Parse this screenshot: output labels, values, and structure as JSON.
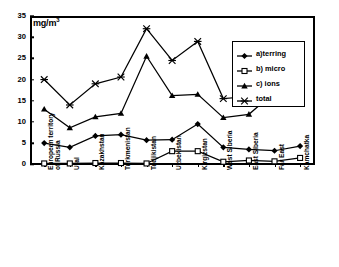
{
  "chart_data": {
    "type": "line",
    "title": "",
    "subtitle": "",
    "unit_label": "mg/m3",
    "unit_label_display": "mg/m",
    "unit_exponent": "3",
    "xlabel": "",
    "ylabel": "",
    "ylim": [
      0,
      35
    ],
    "ytick_step": 5,
    "yticks": [
      0,
      5,
      10,
      15,
      20,
      25,
      30,
      35
    ],
    "ytick_labels": [
      "0",
      "5",
      "10",
      "15",
      "20",
      "25",
      "30",
      "35"
    ],
    "grid": false,
    "legend_position": "upper right (boxed, inside plot)",
    "categories": [
      "European territory\nof Russia",
      "Ural",
      "Kazakhstan",
      "Turkmenistan",
      "Tadjikistan",
      "Uzbekistan",
      "Kirgizstan",
      "West Siberia",
      "East Siberia",
      "Far East",
      "Kamchatka"
    ],
    "series": [
      {
        "name": "a)terring",
        "marker": "diamond",
        "color": "#000000",
        "values": [
          5.0,
          4.0,
          6.7,
          7.0,
          5.7,
          5.8,
          9.5,
          4.0,
          3.5,
          3.2,
          4.3
        ]
      },
      {
        "name": "b) micro",
        "marker": "square-open",
        "color": "#000000",
        "values": [
          0.2,
          0.2,
          0.3,
          0.3,
          0.2,
          3.1,
          3.1,
          0.6,
          0.9,
          0.7,
          1.5
        ]
      },
      {
        "name": "c) ions",
        "marker": "triangle",
        "color": "#000000",
        "values": [
          13.0,
          8.6,
          11.2,
          12.0,
          25.5,
          16.2,
          16.5,
          11.0,
          11.8,
          17.0,
          19.6
        ]
      },
      {
        "name": "total",
        "marker": "cross-star",
        "color": "#000000",
        "values": [
          20.0,
          14.0,
          19.0,
          20.6,
          32.0,
          24.5,
          29.0,
          15.5,
          16.0,
          21.0,
          23.5
        ]
      }
    ]
  },
  "legend": {
    "items": [
      {
        "label": "a)terring",
        "marker": "diamond"
      },
      {
        "label": "b) micro",
        "marker": "square-open"
      },
      {
        "label": "c) ions",
        "marker": "triangle"
      },
      {
        "label": "total",
        "marker": "cross-star"
      }
    ]
  }
}
